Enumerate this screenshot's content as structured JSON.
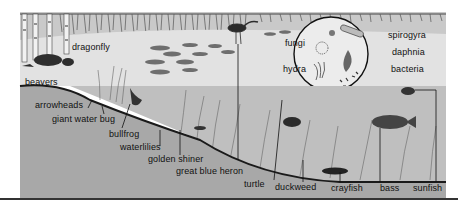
{
  "diagram": {
    "inset_title": "microscopic organisms",
    "labels": {
      "dragonfly": "dragonfly",
      "beavers": "beavers",
      "arrowheads": "arrowheads",
      "giant_water_bug": "giant water bug",
      "bullfrog": "bullfrog",
      "waterlilies": "waterlilies",
      "golden_shiner": "golden shiner",
      "great_blue_heron": "great blue heron",
      "turtle": "turtle",
      "duckweed": "duckweed",
      "crayfish": "crayfish",
      "bass": "bass",
      "sunfish": "sunfish",
      "fungi": "fungi",
      "hydra": "hydra",
      "spirogyra": "spirogyra",
      "daphnia": "daphnia",
      "bacteria": "bacteria"
    },
    "colors": {
      "sky": "#d9d9d9",
      "far_bank": "#bdbdbd",
      "water": "#cfcfcf",
      "sediment": "#a9a9a9",
      "ink": "#1a1a1a"
    }
  }
}
